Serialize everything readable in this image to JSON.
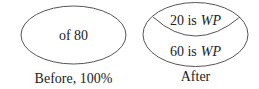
{
  "diagram": {
    "before": {
      "label": "of 80",
      "caption": "Before, 100%"
    },
    "after": {
      "top_number": "20 is",
      "top_var": "WP",
      "bottom_number": "60 is",
      "bottom_var": "WP",
      "caption": "After"
    },
    "colors": {
      "stroke": "#555555",
      "text": "#222222",
      "background": "#ffffff"
    }
  }
}
